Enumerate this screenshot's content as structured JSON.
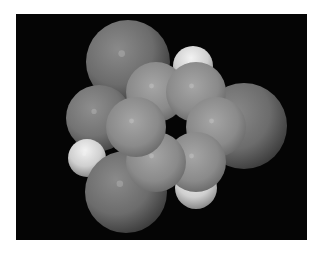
{
  "image": {
    "subject": "space-filling molecular model",
    "description": "Space-filling model of a substituted benzene ring on black background",
    "background_color": "#050505",
    "atoms": [
      {
        "id": "sub-top-left",
        "element_role": "large-substituent",
        "color": "#6e6e6e"
      },
      {
        "id": "sub-right",
        "element_role": "large-substituent",
        "color": "#6e6e6e"
      },
      {
        "id": "sub-bottom-left",
        "element_role": "large-substituent",
        "color": "#6e6e6e"
      },
      {
        "id": "sub-left-o",
        "element_role": "oxygen",
        "color": "#7a7a7a"
      },
      {
        "id": "h-hydroxyl",
        "element_role": "hydrogen",
        "color": "#d8d8d8"
      },
      {
        "id": "h-top",
        "element_role": "hydrogen",
        "color": "#d8d8d8"
      },
      {
        "id": "h-bottom",
        "element_role": "hydrogen",
        "color": "#d8d8d8"
      },
      {
        "id": "ring-carbon-1",
        "element_role": "carbon",
        "color": "#8c8c8c"
      },
      {
        "id": "ring-carbon-2",
        "element_role": "carbon",
        "color": "#8c8c8c"
      },
      {
        "id": "ring-carbon-3",
        "element_role": "carbon",
        "color": "#8c8c8c"
      },
      {
        "id": "ring-carbon-4",
        "element_role": "carbon",
        "color": "#8c8c8c"
      },
      {
        "id": "ring-carbon-5",
        "element_role": "carbon",
        "color": "#8c8c8c"
      },
      {
        "id": "ring-carbon-6",
        "element_role": "carbon",
        "color": "#8c8c8c"
      }
    ]
  }
}
